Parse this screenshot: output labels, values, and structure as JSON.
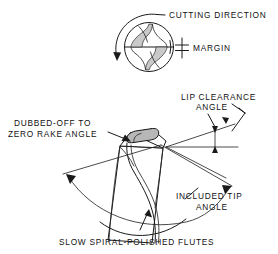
{
  "figure": {
    "background_color": "#ffffff",
    "line_color": "#1a1a1a",
    "shade_color": "#b7b7b7",
    "width": 278,
    "height": 254
  },
  "labels": {
    "cutting_direction": "CUTTING  DIRECTION",
    "margin": "MARGIN",
    "lip_clearance_line1": "LIP  CLEARANCE",
    "lip_clearance_line2": "ANGLE",
    "dubbed_off_line1": "DUBBED-OFF  TO",
    "dubbed_off_line2": "ZERO RAKE ANGLE",
    "included_tip_line1": "INCLUDED  TIP",
    "included_tip_line2": "ANGLE",
    "slow_spiral": "SLOW  SPIRAL-POLISHED  FLUTES"
  },
  "icons": {
    "rotation_arrow": "curved-rotation-arrow-icon",
    "margin_dimension": "dimension-tick-icon",
    "leader_arrow": "leader-arrow-icon",
    "angle_arc": "angle-arc-icon"
  },
  "views": {
    "top_view": "drill-cross-section-circle",
    "bottom_view": "drill-tip-perspective"
  }
}
